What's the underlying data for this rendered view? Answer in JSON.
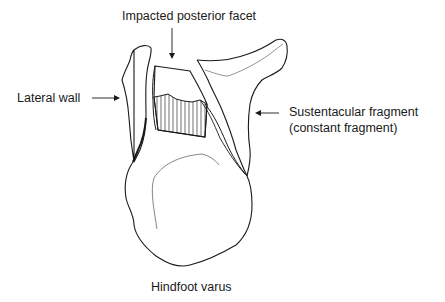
{
  "figure": {
    "title": "Hindfoot varus",
    "labels": {
      "impacted_posterior_facet": "Impacted posterior facet",
      "lateral_wall": "Lateral wall",
      "sustentacular_line1": "Sustentacular fragment",
      "sustentacular_line2": "(constant fragment)"
    },
    "colors": {
      "line": "#1a1a1a",
      "thin_line": "#555555",
      "background": "#ffffff"
    }
  }
}
